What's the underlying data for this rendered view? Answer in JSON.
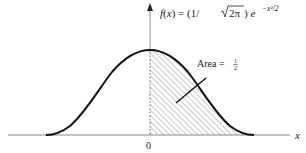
{
  "figure": {
    "function_label": {
      "prefix": "f(x) = (1/",
      "sqrt_arg": "2π",
      "mid": ") e",
      "exponent": "−x²/2"
    },
    "area_label": {
      "text": "Area = ",
      "fraction_num": "1",
      "fraction_den": "2"
    },
    "x_axis_label": "x",
    "origin_label": "0",
    "colors": {
      "curve": "#111111",
      "axis": "#888888",
      "hatch": "#777777"
    }
  }
}
